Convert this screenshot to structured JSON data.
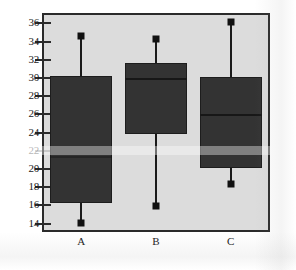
{
  "chart_data": {
    "type": "box",
    "title": "",
    "xlabel": "",
    "ylabel": "",
    "categories": [
      "A",
      "B",
      "C"
    ],
    "ylim": [
      13.2,
      36.8
    ],
    "yticks": [
      36,
      34,
      32,
      30,
      28,
      26,
      24,
      22,
      20,
      18,
      16,
      14
    ],
    "ytick_labels": [
      "36",
      "34",
      "32",
      "30",
      "28",
      "26",
      "24",
      "22",
      "20",
      "18",
      "16",
      "14"
    ],
    "grid": false,
    "legend": null,
    "boxes": [
      {
        "label": "A",
        "whisker_low": 14.0,
        "q1": 16.2,
        "median": 21.3,
        "q3": 30.1,
        "whisker_high": 34.5
      },
      {
        "label": "B",
        "whisker_low": 15.8,
        "q1": 23.7,
        "median": 29.9,
        "q3": 31.5,
        "whisker_high": 34.2
      },
      {
        "label": "C",
        "whisker_low": 18.2,
        "q1": 20.0,
        "median": 25.9,
        "q3": 30.0,
        "whisker_high": 36.0
      }
    ],
    "colors": {
      "box_fill": "#333333",
      "box_edge": "#1d1d1d",
      "median_line": "#171717",
      "whisker": "#1a1a1a",
      "cap_marker": "#111111",
      "plot_background": "#dcdcdc",
      "frame": "#2b2b2b",
      "page_background": "#ffffff",
      "tick_text": "#1a1a1a"
    }
  }
}
